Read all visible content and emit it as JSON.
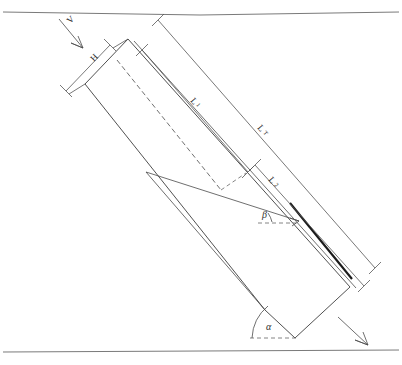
{
  "diagram": {
    "type": "engineering-line-drawing",
    "background_color": "#ffffff",
    "ink_color": "#3d3d3d",
    "labels": {
      "velocity": "V",
      "height": "H",
      "length_1_base": "L",
      "length_1_sub": "1",
      "length_total_base": "L",
      "length_total_sub": "T",
      "length_2_base": "L",
      "length_2_sub": "2",
      "angle_alpha": "α",
      "angle_beta": "β"
    },
    "annotations": [
      {
        "name": "velocity-arrow",
        "label": "V",
        "description": "incoming flow vector, top-left, pointing down-right"
      },
      {
        "name": "height-dimension",
        "label": "H",
        "description": "short dimension across the upper-left end face"
      },
      {
        "name": "length-one-dimension",
        "label": "L1",
        "description": "dimension along upper wall, upper segment"
      },
      {
        "name": "length-total-dimension",
        "label": "LT",
        "description": "overall outer dimension along full slope"
      },
      {
        "name": "length-two-dimension",
        "label": "L2",
        "description": "lower segment dimension along slope"
      },
      {
        "name": "alpha-angle",
        "label": "α",
        "description": "inclination of channel to horizontal datum, lower right"
      },
      {
        "name": "beta-angle",
        "label": "β",
        "description": "angle of internal wedge ray to horizontal reference"
      },
      {
        "name": "outflow-arrow",
        "label": "",
        "description": "discharge direction arrow, bottom-right"
      },
      {
        "name": "datum-line-top",
        "label": "",
        "description": "upper horizontal boundary line"
      },
      {
        "name": "datum-line-bottom",
        "label": "",
        "description": "lower horizontal boundary line"
      }
    ]
  }
}
